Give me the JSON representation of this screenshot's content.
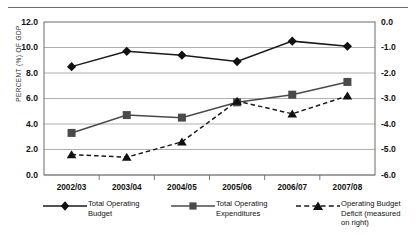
{
  "chart_data": {
    "type": "line",
    "title": "",
    "xlabel": "",
    "ylabel": "PERCENT (%) OF GDP",
    "y2label": "",
    "categories": [
      "2002/03",
      "2003/04",
      "2004/05",
      "2005/06",
      "2006/07",
      "2007/08"
    ],
    "ylim": [
      0.0,
      12.0
    ],
    "yticks": [
      "0.0",
      "2.0",
      "4.0",
      "6.0",
      "8.0",
      "10.0",
      "12.0"
    ],
    "ytick_values": [
      0.0,
      2.0,
      4.0,
      6.0,
      8.0,
      10.0,
      12.0
    ],
    "y2lim": [
      -6.0,
      0.0
    ],
    "y2ticks": [
      "-6.0",
      "-5.0",
      "-4.0",
      "-3.0",
      "-2.0",
      "-1.0",
      "0.0"
    ],
    "y2tick_values": [
      -6.0,
      -5.0,
      -4.0,
      -3.0,
      -2.0,
      -1.0,
      0.0
    ],
    "grid": true,
    "legend_position": "bottom",
    "series": [
      {
        "name": "Total Operating Budget",
        "legend_label_line1": "Total Operating",
        "legend_label_line2": "Budget",
        "marker": "diamond",
        "linestyle": "solid",
        "axis": "left",
        "color": "#1a1a1a",
        "values": [
          8.5,
          9.7,
          9.4,
          8.9,
          10.5,
          10.1
        ]
      },
      {
        "name": "Total Operating Expenditures",
        "legend_label_line1": "Total Operating",
        "legend_label_line2": "Expenditures",
        "marker": "square",
        "linestyle": "solid",
        "axis": "left",
        "color": "#4a4a4a",
        "values": [
          3.3,
          4.7,
          4.5,
          5.7,
          6.3,
          7.3
        ]
      },
      {
        "name": "Operating Budget Deficit (measured on right)",
        "legend_label_line1": "Operating Budget",
        "legend_label_line2": "Deficit (measured",
        "legend_label_line3": "on right)",
        "marker": "triangle",
        "linestyle": "dashed",
        "axis": "right",
        "color": "#1a1a1a",
        "values": [
          -5.2,
          -5.3,
          -4.7,
          -3.1,
          -3.6,
          -2.9
        ]
      }
    ]
  }
}
